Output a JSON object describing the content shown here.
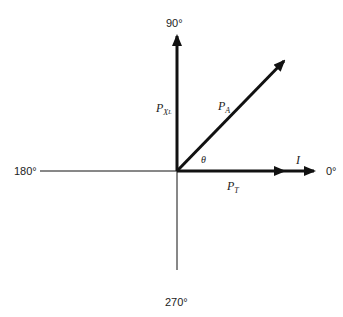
{
  "diagram": {
    "type": "phasor-diagram",
    "axis_labels": {
      "top": "90°",
      "left": "180°",
      "right": "0°",
      "bottom": "270°"
    },
    "vectors": [
      {
        "name": "P_XL",
        "label_main": "P",
        "label_sub": "X",
        "label_subsub": "L",
        "angle_deg": 90
      },
      {
        "name": "P_A",
        "label_main": "P",
        "label_sub": "A",
        "angle_deg": 45
      },
      {
        "name": "P_T",
        "label_main": "P",
        "label_sub": "T",
        "angle_deg": 0
      },
      {
        "name": "I",
        "label_main": "I",
        "angle_deg": 0
      }
    ],
    "angle_label": "θ",
    "colors": {
      "line": "#111111",
      "text": "#222222",
      "background": "#ffffff"
    }
  }
}
